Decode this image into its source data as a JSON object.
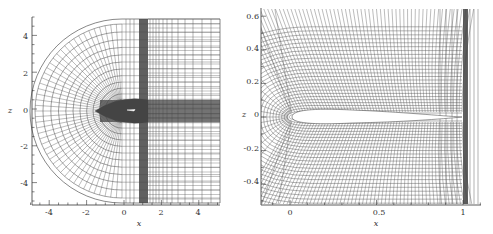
{
  "figure": {
    "left_panel": {
      "description": "C-type computational mesh around airfoil, far-field view",
      "xlabel": "x",
      "ylabel": "z",
      "xticks": [
        "-4",
        "-2",
        "0",
        "2",
        "4"
      ],
      "yticks": [
        "4",
        "2",
        "0",
        "-2",
        "-4"
      ],
      "xlim": [
        -5,
        5
      ],
      "ylim": [
        -5.2,
        5
      ]
    },
    "right_panel": {
      "description": "Near-field view of mesh around airfoil",
      "xlabel": "x",
      "ylabel": "z",
      "xticks": [
        "0",
        "0.5",
        "1"
      ],
      "yticks": [
        "0.6",
        "0.4",
        "0.2",
        "0",
        "-0.2",
        "-0.4"
      ],
      "xlim": [
        -0.15,
        1.1
      ],
      "ylim": [
        -0.55,
        0.65
      ]
    },
    "colors": {
      "mesh_line": "#555555",
      "dense_band": "#444444",
      "axis": "#333333",
      "background": "#ffffff"
    }
  }
}
